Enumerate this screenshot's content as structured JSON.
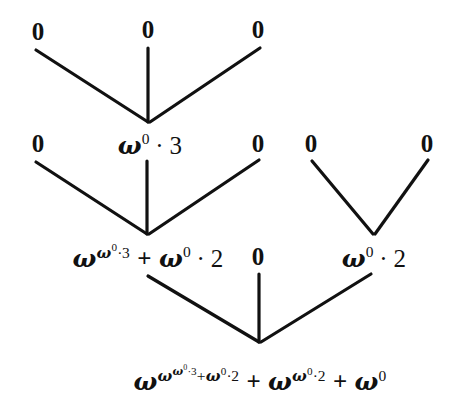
{
  "diagram": {
    "kind": "ordinal-notation-tree",
    "background_color": "#ffffff",
    "line_color": "#111111",
    "text_color": "#111111",
    "rows": [
      {
        "row": 1,
        "nodes": [
          {
            "label": "0",
            "x": 38,
            "y": 31
          },
          {
            "label": "0",
            "x": 148,
            "y": 29
          },
          {
            "label": "0",
            "x": 258,
            "y": 29
          }
        ]
      },
      {
        "row": 2,
        "nodes": [
          {
            "label": "0",
            "x": 38,
            "y": 143
          },
          {
            "label": "ω⁰·3",
            "x": 150,
            "y": 145
          },
          {
            "label": "0",
            "x": 258,
            "y": 143
          },
          {
            "label": "0",
            "x": 311,
            "y": 143
          },
          {
            "label": "0",
            "x": 427,
            "y": 143
          }
        ]
      },
      {
        "row": 3,
        "nodes": [
          {
            "label": "ω^(ω⁰·3) + ω⁰·2",
            "x": 148,
            "y": 258
          },
          {
            "label": "0",
            "x": 258,
            "y": 256
          },
          {
            "label": "ω⁰·2",
            "x": 374,
            "y": 258
          }
        ]
      },
      {
        "row": 4,
        "nodes": [
          {
            "label": "ω^(ω^(ω⁰·3)+ω⁰·2) + ω^(ω⁰·2) + ω⁰",
            "x": 260,
            "y": 381
          }
        ]
      }
    ],
    "edges": [
      {
        "name": "edge-r1c1-to-r2c2",
        "x1": 36,
        "y1": 50,
        "x2": 148,
        "y2": 122
      },
      {
        "name": "edge-r1c2-to-r2c2",
        "x1": 148,
        "y1": 48,
        "x2": 148,
        "y2": 122
      },
      {
        "name": "edge-r1c3-to-r2c2",
        "x1": 260,
        "y1": 48,
        "x2": 150,
        "y2": 122
      },
      {
        "name": "edge-r2c1-to-r3c1",
        "x1": 36,
        "y1": 162,
        "x2": 147,
        "y2": 234
      },
      {
        "name": "edge-r2c2-to-r3c1",
        "x1": 147,
        "y1": 161,
        "x2": 147,
        "y2": 234
      },
      {
        "name": "edge-r2c3-to-r3c1",
        "x1": 259,
        "y1": 160,
        "x2": 149,
        "y2": 234
      },
      {
        "name": "edge-r2c4-to-r3c3",
        "x1": 312,
        "y1": 161,
        "x2": 373,
        "y2": 234
      },
      {
        "name": "edge-r2c5-to-r3c3",
        "x1": 428,
        "y1": 160,
        "x2": 375,
        "y2": 234
      },
      {
        "name": "edge-r3c1-to-r4c1",
        "x1": 148,
        "y1": 276,
        "x2": 259,
        "y2": 342
      },
      {
        "name": "edge-r3c2-to-r4c1",
        "x1": 259,
        "y1": 274,
        "x2": 259,
        "y2": 342
      },
      {
        "name": "edge-r3c3-to-r4c1",
        "x1": 371,
        "y1": 274,
        "x2": 261,
        "y2": 342
      }
    ]
  },
  "symbols": {
    "omega": "ω",
    "zero": "0",
    "plus": "+",
    "cdot": "·",
    "two": "2",
    "three": "3"
  },
  "labels": {
    "r1_n1": "0",
    "r1_n2": "0",
    "r1_n3": "0",
    "r2_n1": "0",
    "r2_n3": "0",
    "r2_n4": "0",
    "r2_n5": "0",
    "r3_n2": "0"
  }
}
